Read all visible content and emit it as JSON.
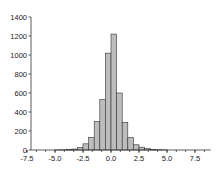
{
  "chart_data": {
    "type": "bar",
    "title": "",
    "xlabel": "",
    "ylabel": "",
    "bin_width": 0.5,
    "bins": [
      {
        "x0": -7.5,
        "x1": -7.0,
        "count": 0
      },
      {
        "x0": -7.0,
        "x1": -6.5,
        "count": 0
      },
      {
        "x0": -6.5,
        "x1": -6.0,
        "count": 0
      },
      {
        "x0": -6.0,
        "x1": -5.5,
        "count": 0
      },
      {
        "x0": -5.5,
        "x1": -5.0,
        "count": 0
      },
      {
        "x0": -5.0,
        "x1": -4.5,
        "count": 1
      },
      {
        "x0": -4.5,
        "x1": -4.0,
        "count": 2
      },
      {
        "x0": -4.0,
        "x1": -3.5,
        "count": 5
      },
      {
        "x0": -3.5,
        "x1": -3.0,
        "count": 10
      },
      {
        "x0": -3.0,
        "x1": -2.5,
        "count": 25
      },
      {
        "x0": -2.5,
        "x1": -2.0,
        "count": 65
      },
      {
        "x0": -2.0,
        "x1": -1.5,
        "count": 130
      },
      {
        "x0": -1.5,
        "x1": -1.0,
        "count": 300
      },
      {
        "x0": -1.0,
        "x1": -0.5,
        "count": 530
      },
      {
        "x0": -0.5,
        "x1": 0.0,
        "count": 1020
      },
      {
        "x0": 0.0,
        "x1": 0.5,
        "count": 1220
      },
      {
        "x0": 0.5,
        "x1": 1.0,
        "count": 600
      },
      {
        "x0": 1.0,
        "x1": 1.5,
        "count": 290
      },
      {
        "x0": 1.5,
        "x1": 2.0,
        "count": 130
      },
      {
        "x0": 2.0,
        "x1": 2.5,
        "count": 55
      },
      {
        "x0": 2.5,
        "x1": 3.0,
        "count": 30
      },
      {
        "x0": 3.0,
        "x1": 3.5,
        "count": 15
      },
      {
        "x0": 3.5,
        "x1": 4.0,
        "count": 6
      },
      {
        "x0": 4.0,
        "x1": 4.5,
        "count": 3
      },
      {
        "x0": 4.5,
        "x1": 5.0,
        "count": 1
      },
      {
        "x0": 5.0,
        "x1": 5.5,
        "count": 0
      },
      {
        "x0": 5.5,
        "x1": 6.0,
        "count": 0
      },
      {
        "x0": 6.0,
        "x1": 6.5,
        "count": 0
      },
      {
        "x0": 6.5,
        "x1": 7.0,
        "count": 0
      },
      {
        "x0": 7.0,
        "x1": 7.5,
        "count": 0
      },
      {
        "x0": 7.5,
        "x1": 8.0,
        "count": 0
      },
      {
        "x0": 8.0,
        "x1": 8.5,
        "count": 0
      },
      {
        "x0": 8.5,
        "x1": 9.0,
        "count": 0
      }
    ],
    "xlim": [
      -7.7,
      8.9
    ],
    "ylim": [
      0,
      1400
    ],
    "x_ticks": [
      -7.5,
      -5.0,
      -2.5,
      0.0,
      2.5,
      5.0,
      7.5
    ],
    "x_tick_labels": [
      "-7.5",
      "-5.0",
      "-2.5",
      "0.0",
      "2.5",
      "5.0",
      "7.5"
    ],
    "y_ticks": [
      0,
      200,
      400,
      600,
      800,
      1000,
      1200,
      1400
    ],
    "y_tick_labels": [
      "0",
      "200",
      "400",
      "600",
      "800",
      "1000",
      "1200",
      "1400"
    ],
    "grid": false,
    "legend": null,
    "colors": {
      "bar_fill": "#bdbdbd",
      "bar_edge": "#333333"
    }
  }
}
